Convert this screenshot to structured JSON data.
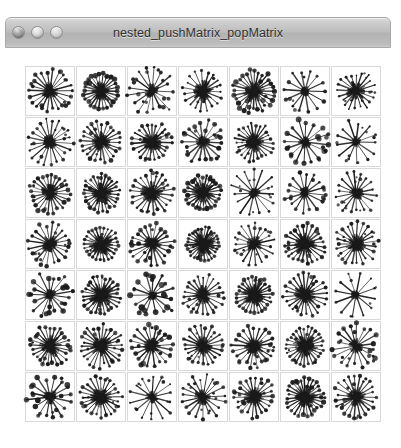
{
  "window": {
    "title": "nested_pushMatrix_popMatrix",
    "controls": [
      {
        "name": "close",
        "label": "Close"
      },
      {
        "name": "minimize",
        "label": "Minimize"
      },
      {
        "name": "zoom",
        "label": "Zoom"
      }
    ]
  },
  "canvas": {
    "name": "processing-sketch-canvas",
    "background": "#ffffff",
    "width": 386,
    "height": 395
  },
  "chart_data": {
    "type": "scatter",
    "title": "nested_pushMatrix_popMatrix",
    "grid": {
      "rows": 7,
      "cols": 7,
      "cell_size": 50,
      "gap": 1,
      "origin_x": 20,
      "origin_y": 18
    },
    "xlabel": "",
    "ylabel": "",
    "grid_lines": true,
    "legend": "none",
    "stroke_color": "#1a1a1a",
    "cell_border_color": "#d9d9d9",
    "cells": [
      {
        "r": 0,
        "c": 0,
        "rays": 22,
        "ray_len": 20,
        "dot_r": 1.9,
        "core": 7,
        "seed": 11,
        "jitter": 0.22,
        "len_var": 0.3
      },
      {
        "r": 0,
        "c": 1,
        "rays": 26,
        "ray_len": 17,
        "dot_r": 2.2,
        "core": 8,
        "seed": 27,
        "jitter": 0.1,
        "len_var": 0.14
      },
      {
        "r": 0,
        "c": 2,
        "rays": 17,
        "ray_len": 21,
        "dot_r": 1.7,
        "core": 6,
        "seed": 43,
        "jitter": 0.4,
        "len_var": 0.42
      },
      {
        "r": 0,
        "c": 3,
        "rays": 19,
        "ray_len": 19,
        "dot_r": 1.3,
        "core": 9,
        "seed": 58,
        "jitter": 0.18,
        "len_var": 0.22
      },
      {
        "r": 0,
        "c": 4,
        "rays": 28,
        "ray_len": 20,
        "dot_r": 2.1,
        "core": 9,
        "seed": 72,
        "jitter": 0.2,
        "len_var": 0.26
      },
      {
        "r": 0,
        "c": 5,
        "rays": 14,
        "ray_len": 20,
        "dot_r": 1.8,
        "core": 4,
        "seed": 86,
        "jitter": 0.16,
        "len_var": 0.2
      },
      {
        "r": 0,
        "c": 6,
        "rays": 20,
        "ray_len": 18,
        "dot_r": 1.2,
        "core": 8,
        "seed": 99,
        "jitter": 0.26,
        "len_var": 0.3
      },
      {
        "r": 1,
        "c": 0,
        "rays": 21,
        "ray_len": 21,
        "dot_r": 1.5,
        "core": 6,
        "seed": 113,
        "jitter": 0.24,
        "len_var": 0.3
      },
      {
        "r": 1,
        "c": 1,
        "rays": 24,
        "ray_len": 19,
        "dot_r": 1.9,
        "core": 8,
        "seed": 128,
        "jitter": 0.18,
        "len_var": 0.24
      },
      {
        "r": 1,
        "c": 2,
        "rays": 23,
        "ray_len": 18,
        "dot_r": 1.6,
        "core": 9,
        "seed": 141,
        "jitter": 0.22,
        "len_var": 0.28
      },
      {
        "r": 1,
        "c": 3,
        "rays": 18,
        "ray_len": 20,
        "dot_r": 2.0,
        "core": 6,
        "seed": 155,
        "jitter": 0.3,
        "len_var": 0.34
      },
      {
        "r": 1,
        "c": 4,
        "rays": 25,
        "ray_len": 18,
        "dot_r": 1.5,
        "core": 8,
        "seed": 169,
        "jitter": 0.2,
        "len_var": 0.26
      },
      {
        "r": 1,
        "c": 5,
        "rays": 16,
        "ray_len": 21,
        "dot_r": 2.3,
        "core": 5,
        "seed": 183,
        "jitter": 0.34,
        "len_var": 0.36
      },
      {
        "r": 1,
        "c": 6,
        "rays": 13,
        "ray_len": 20,
        "dot_r": 1.4,
        "core": 4,
        "seed": 197,
        "jitter": 0.28,
        "len_var": 0.32
      },
      {
        "r": 2,
        "c": 0,
        "rays": 24,
        "ray_len": 19,
        "dot_r": 2.0,
        "core": 8,
        "seed": 211,
        "jitter": 0.2,
        "len_var": 0.26
      },
      {
        "r": 2,
        "c": 1,
        "rays": 27,
        "ray_len": 18,
        "dot_r": 1.7,
        "core": 10,
        "seed": 225,
        "jitter": 0.16,
        "len_var": 0.22
      },
      {
        "r": 2,
        "c": 2,
        "rays": 22,
        "ray_len": 20,
        "dot_r": 1.6,
        "core": 9,
        "seed": 239,
        "jitter": 0.26,
        "len_var": 0.3
      },
      {
        "r": 2,
        "c": 3,
        "rays": 26,
        "ray_len": 17,
        "dot_r": 2.1,
        "core": 10,
        "seed": 253,
        "jitter": 0.14,
        "len_var": 0.2
      },
      {
        "r": 2,
        "c": 4,
        "rays": 15,
        "ray_len": 21,
        "dot_r": 1.3,
        "core": 5,
        "seed": 267,
        "jitter": 0.3,
        "len_var": 0.34
      },
      {
        "r": 2,
        "c": 5,
        "rays": 16,
        "ray_len": 19,
        "dot_r": 1.9,
        "core": 5,
        "seed": 281,
        "jitter": 0.24,
        "len_var": 0.28
      },
      {
        "r": 2,
        "c": 6,
        "rays": 18,
        "ray_len": 20,
        "dot_r": 1.4,
        "core": 6,
        "seed": 295,
        "jitter": 0.32,
        "len_var": 0.36
      },
      {
        "r": 3,
        "c": 0,
        "rays": 20,
        "ray_len": 20,
        "dot_r": 1.8,
        "core": 7,
        "seed": 309,
        "jitter": 0.22,
        "len_var": 0.28
      },
      {
        "r": 3,
        "c": 1,
        "rays": 25,
        "ray_len": 17,
        "dot_r": 1.6,
        "core": 10,
        "seed": 323,
        "jitter": 0.16,
        "len_var": 0.22
      },
      {
        "r": 3,
        "c": 2,
        "rays": 21,
        "ray_len": 20,
        "dot_r": 2.0,
        "core": 7,
        "seed": 337,
        "jitter": 0.28,
        "len_var": 0.32
      },
      {
        "r": 3,
        "c": 3,
        "rays": 28,
        "ray_len": 16,
        "dot_r": 1.7,
        "core": 11,
        "seed": 351,
        "jitter": 0.14,
        "len_var": 0.18
      },
      {
        "r": 3,
        "c": 4,
        "rays": 19,
        "ray_len": 19,
        "dot_r": 1.5,
        "core": 7,
        "seed": 365,
        "jitter": 0.26,
        "len_var": 0.3
      },
      {
        "r": 3,
        "c": 5,
        "rays": 24,
        "ray_len": 19,
        "dot_r": 1.8,
        "core": 9,
        "seed": 379,
        "jitter": 0.2,
        "len_var": 0.26
      },
      {
        "r": 3,
        "c": 6,
        "rays": 23,
        "ray_len": 20,
        "dot_r": 1.6,
        "core": 8,
        "seed": 393,
        "jitter": 0.24,
        "len_var": 0.3
      },
      {
        "r": 4,
        "c": 0,
        "rays": 17,
        "ray_len": 20,
        "dot_r": 2.2,
        "core": 5,
        "seed": 407,
        "jitter": 0.32,
        "len_var": 0.38
      },
      {
        "r": 4,
        "c": 1,
        "rays": 26,
        "ray_len": 18,
        "dot_r": 1.7,
        "core": 10,
        "seed": 421,
        "jitter": 0.18,
        "len_var": 0.24
      },
      {
        "r": 4,
        "c": 2,
        "rays": 15,
        "ray_len": 21,
        "dot_r": 2.4,
        "core": 4,
        "seed": 435,
        "jitter": 0.36,
        "len_var": 0.4
      },
      {
        "r": 4,
        "c": 3,
        "rays": 22,
        "ray_len": 19,
        "dot_r": 1.5,
        "core": 8,
        "seed": 449,
        "jitter": 0.22,
        "len_var": 0.28
      },
      {
        "r": 4,
        "c": 4,
        "rays": 27,
        "ray_len": 17,
        "dot_r": 1.8,
        "core": 10,
        "seed": 463,
        "jitter": 0.16,
        "len_var": 0.22
      },
      {
        "r": 4,
        "c": 5,
        "rays": 24,
        "ray_len": 20,
        "dot_r": 1.6,
        "core": 9,
        "seed": 477,
        "jitter": 0.2,
        "len_var": 0.26
      },
      {
        "r": 4,
        "c": 6,
        "rays": 12,
        "ray_len": 21,
        "dot_r": 1.3,
        "core": 4,
        "seed": 491,
        "jitter": 0.14,
        "len_var": 0.18
      },
      {
        "r": 5,
        "c": 0,
        "rays": 25,
        "ray_len": 19,
        "dot_r": 1.9,
        "core": 9,
        "seed": 505,
        "jitter": 0.2,
        "len_var": 0.26
      },
      {
        "r": 5,
        "c": 1,
        "rays": 26,
        "ray_len": 20,
        "dot_r": 1.7,
        "core": 9,
        "seed": 519,
        "jitter": 0.24,
        "len_var": 0.3
      },
      {
        "r": 5,
        "c": 2,
        "rays": 20,
        "ray_len": 20,
        "dot_r": 2.1,
        "core": 7,
        "seed": 533,
        "jitter": 0.28,
        "len_var": 0.32
      },
      {
        "r": 5,
        "c": 3,
        "rays": 23,
        "ray_len": 19,
        "dot_r": 1.6,
        "core": 8,
        "seed": 547,
        "jitter": 0.22,
        "len_var": 0.28
      },
      {
        "r": 5,
        "c": 4,
        "rays": 21,
        "ray_len": 20,
        "dot_r": 1.8,
        "core": 8,
        "seed": 561,
        "jitter": 0.26,
        "len_var": 0.3
      },
      {
        "r": 5,
        "c": 5,
        "rays": 27,
        "ray_len": 18,
        "dot_r": 1.5,
        "core": 10,
        "seed": 575,
        "jitter": 0.18,
        "len_var": 0.24
      },
      {
        "r": 5,
        "c": 6,
        "rays": 18,
        "ray_len": 21,
        "dot_r": 2.0,
        "core": 6,
        "seed": 589,
        "jitter": 0.3,
        "len_var": 0.34
      },
      {
        "r": 6,
        "c": 0,
        "rays": 16,
        "ray_len": 20,
        "dot_r": 2.2,
        "core": 6,
        "seed": 603,
        "jitter": 0.34,
        "len_var": 0.38
      },
      {
        "r": 6,
        "c": 1,
        "rays": 24,
        "ray_len": 19,
        "dot_r": 1.7,
        "core": 9,
        "seed": 617,
        "jitter": 0.22,
        "len_var": 0.28
      },
      {
        "r": 6,
        "c": 2,
        "rays": 14,
        "ray_len": 21,
        "dot_r": 1.4,
        "core": 5,
        "seed": 631,
        "jitter": 0.26,
        "len_var": 0.32
      },
      {
        "r": 6,
        "c": 3,
        "rays": 19,
        "ray_len": 20,
        "dot_r": 1.6,
        "core": 7,
        "seed": 645,
        "jitter": 0.28,
        "len_var": 0.32
      },
      {
        "r": 6,
        "c": 4,
        "rays": 22,
        "ray_len": 19,
        "dot_r": 1.9,
        "core": 8,
        "seed": 659,
        "jitter": 0.24,
        "len_var": 0.3
      },
      {
        "r": 6,
        "c": 5,
        "rays": 27,
        "ray_len": 18,
        "dot_r": 2.0,
        "core": 10,
        "seed": 673,
        "jitter": 0.18,
        "len_var": 0.24
      },
      {
        "r": 6,
        "c": 6,
        "rays": 23,
        "ray_len": 20,
        "dot_r": 1.7,
        "core": 8,
        "seed": 687,
        "jitter": 0.26,
        "len_var": 0.3
      }
    ]
  }
}
